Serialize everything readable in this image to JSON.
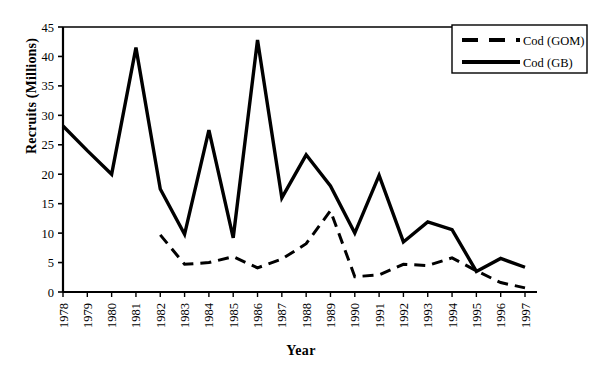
{
  "chart_data": {
    "type": "line",
    "title": "",
    "xlabel": "Year",
    "ylabel": "Recruits (Millions)",
    "categories": [
      "1978",
      "1979",
      "1980",
      "1981",
      "1982",
      "1983",
      "1984",
      "1985",
      "1986",
      "1987",
      "1988",
      "1989",
      "1990",
      "1991",
      "1992",
      "1993",
      "1994",
      "1995",
      "1996",
      "1997"
    ],
    "ylim": [
      0,
      45
    ],
    "yticks": [
      0,
      5,
      10,
      15,
      20,
      25,
      30,
      35,
      40,
      45
    ],
    "ytick_labels": [
      "0",
      "5",
      "10",
      "15",
      "20",
      "25",
      "30",
      "35",
      "40",
      "45"
    ],
    "grid": false,
    "legend_position": "top-right-inside",
    "series": [
      {
        "name": "Cod (GOM)",
        "style": "dashed",
        "color": "#000000",
        "x": [
          "1982",
          "1983",
          "1984",
          "1985",
          "1986",
          "1987",
          "1988",
          "1989",
          "1990",
          "1991",
          "1992",
          "1993",
          "1994",
          "1995",
          "1996",
          "1997"
        ],
        "values": [
          9.7,
          4.7,
          5.0,
          6.0,
          4.1,
          5.6,
          8.2,
          13.8,
          2.6,
          2.9,
          4.7,
          4.5,
          5.8,
          3.6,
          1.6,
          0.7
        ]
      },
      {
        "name": "Cod (GB)",
        "style": "solid",
        "color": "#000000",
        "x": [
          "1978",
          "1979",
          "1980",
          "1981",
          "1982",
          "1983",
          "1984",
          "1985",
          "1986",
          "1987",
          "1988",
          "1989",
          "1990",
          "1991",
          "1992",
          "1993",
          "1994",
          "1995",
          "1996",
          "1997"
        ],
        "values": [
          28.2,
          24.0,
          20.0,
          41.5,
          17.5,
          9.8,
          27.5,
          9.2,
          42.8,
          16.0,
          23.3,
          18.0,
          10.0,
          19.8,
          8.5,
          11.9,
          10.6,
          3.5,
          5.7,
          4.2
        ]
      }
    ]
  },
  "legend": {
    "items": [
      {
        "label": "Cod (GOM)",
        "style": "dashed"
      },
      {
        "label": "Cod (GB)",
        "style": "solid"
      }
    ]
  }
}
